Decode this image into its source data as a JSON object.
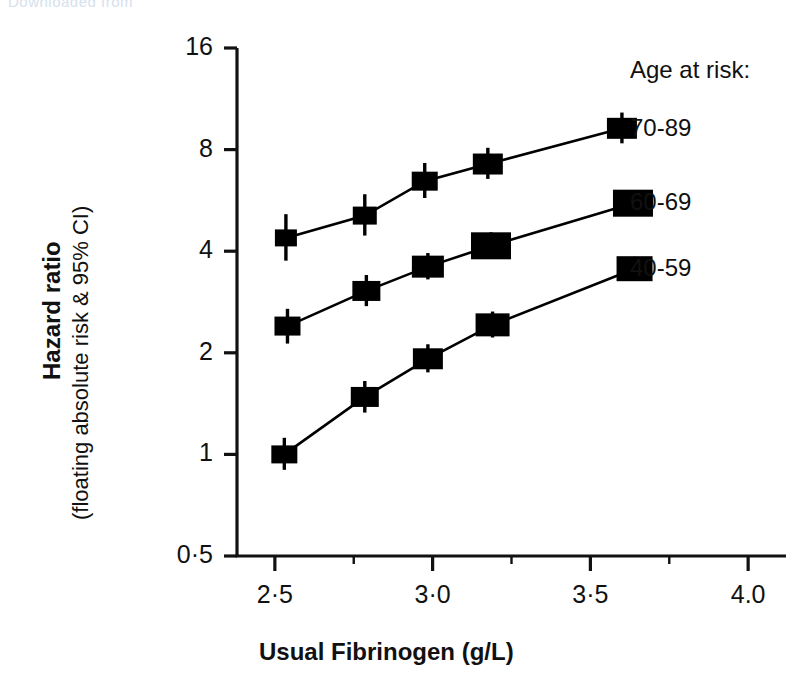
{
  "watermark": {
    "text": "Downloaded from"
  },
  "chart_data": {
    "type": "line",
    "title": "",
    "xlabel": "Usual  Fibrinogen (g/L)",
    "ylabel_main": "Hazard ratio",
    "ylabel_sub": "(floating absolute risk & 95% CI)",
    "xlim": [
      2.38,
      4.12
    ],
    "ylim": [
      0.5,
      16
    ],
    "yscale": "log",
    "grid": false,
    "legend_position": "right",
    "legend_title": "Age at risk:",
    "y_ticks": [
      {
        "value": 16,
        "label": "16"
      },
      {
        "value": 8,
        "label": "8"
      },
      {
        "value": 4,
        "label": "4"
      },
      {
        "value": 2,
        "label": "2"
      },
      {
        "value": 1,
        "label": "1"
      },
      {
        "value": 0.5,
        "label": "0·5"
      }
    ],
    "x_ticks": [
      {
        "value": 2.5,
        "label": "2·5",
        "major": true
      },
      {
        "value": 2.75,
        "label": "",
        "major": false
      },
      {
        "value": 3.0,
        "label": "3·0",
        "major": true
      },
      {
        "value": 3.25,
        "label": "",
        "major": false
      },
      {
        "value": 3.5,
        "label": "3·5",
        "major": true
      },
      {
        "value": 3.75,
        "label": "",
        "major": false
      },
      {
        "value": 4.0,
        "label": "4.0",
        "major": true
      }
    ],
    "series": [
      {
        "name": "70-89",
        "label": "70-89",
        "label_y_value": 9.2,
        "color": "#000000",
        "points": [
          {
            "x": 2.535,
            "y": 4.38,
            "ci_low": 3.75,
            "ci_high": 5.15,
            "box_w": 22,
            "box_h": 17
          },
          {
            "x": 2.785,
            "y": 5.1,
            "ci_low": 4.45,
            "ci_high": 5.9,
            "box_w": 24,
            "box_h": 18
          },
          {
            "x": 2.975,
            "y": 6.45,
            "ci_low": 5.75,
            "ci_high": 7.3,
            "box_w": 26,
            "box_h": 19
          },
          {
            "x": 3.175,
            "y": 7.25,
            "ci_low": 6.55,
            "ci_high": 8.1,
            "box_w": 30,
            "box_h": 21
          },
          {
            "x": 3.6,
            "y": 9.25,
            "ci_low": 8.35,
            "ci_high": 10.3,
            "box_w": 30,
            "box_h": 21
          }
        ]
      },
      {
        "name": "60-69",
        "label": "60-69",
        "label_y_value": 5.55,
        "color": "#000000",
        "points": [
          {
            "x": 2.54,
            "y": 2.4,
            "ci_low": 2.13,
            "ci_high": 2.7,
            "box_w": 26,
            "box_h": 19
          },
          {
            "x": 2.79,
            "y": 3.05,
            "ci_low": 2.75,
            "ci_high": 3.4,
            "box_w": 28,
            "box_h": 20
          },
          {
            "x": 2.985,
            "y": 3.6,
            "ci_low": 3.3,
            "ci_high": 3.95,
            "box_w": 32,
            "box_h": 22
          },
          {
            "x": 3.185,
            "y": 4.15,
            "ci_low": 3.8,
            "ci_high": 4.55,
            "box_w": 40,
            "box_h": 27
          },
          {
            "x": 3.635,
            "y": 5.55,
            "ci_low": 5.15,
            "ci_high": 6.0,
            "box_w": 40,
            "box_h": 27
          }
        ]
      },
      {
        "name": "40-59",
        "label": "40-59",
        "label_y_value": 3.55,
        "color": "#000000",
        "points": [
          {
            "x": 2.53,
            "y": 1.0,
            "ci_low": 0.9,
            "ci_high": 1.12,
            "box_w": 26,
            "box_h": 18
          },
          {
            "x": 2.785,
            "y": 1.48,
            "ci_low": 1.33,
            "ci_high": 1.65,
            "box_w": 28,
            "box_h": 20
          },
          {
            "x": 2.985,
            "y": 1.92,
            "ci_low": 1.75,
            "ci_high": 2.12,
            "box_w": 30,
            "box_h": 21
          },
          {
            "x": 3.19,
            "y": 2.42,
            "ci_low": 2.22,
            "ci_high": 2.65,
            "box_w": 34,
            "box_h": 23
          },
          {
            "x": 3.64,
            "y": 3.55,
            "ci_low": 3.3,
            "ci_high": 3.85,
            "box_w": 36,
            "box_h": 25
          }
        ]
      }
    ]
  }
}
